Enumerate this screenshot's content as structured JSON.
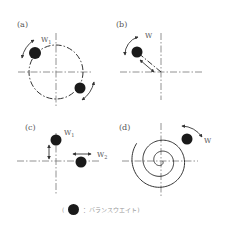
{
  "panels": [
    {
      "id": "a",
      "label": "(a)",
      "weights": [
        {
          "label": "W",
          "sub": "1"
        }
      ],
      "description": "two balance weights on a circular path, each able to move along the circle"
    },
    {
      "id": "b",
      "label": "(b)",
      "weights": [
        {
          "label": "W",
          "sub": ""
        }
      ],
      "description": "one balance weight moving radially and rotating about the center"
    },
    {
      "id": "c",
      "label": "(c)",
      "weights": [
        {
          "label": "W",
          "sub": "1"
        },
        {
          "label": "W",
          "sub": "2"
        }
      ],
      "description": "two balance weights, one moving along the vertical axis, one along the horizontal axis"
    },
    {
      "id": "d",
      "label": "(d)",
      "weights": [
        {
          "label": "W",
          "sub": ""
        }
      ],
      "description": "one balance weight moving along a spiral path"
    }
  ],
  "legend": {
    "open": "(",
    "text": "：バランスウエイト)",
    "icon": "balance-weight-dot"
  }
}
